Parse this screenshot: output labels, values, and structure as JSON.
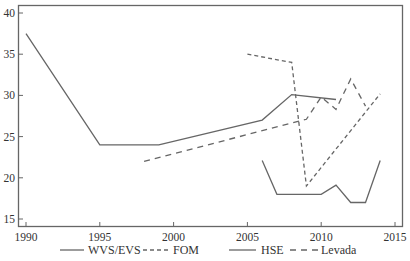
{
  "chart_data": {
    "type": "line",
    "title": "",
    "xlabel": "",
    "ylabel": "",
    "xlim": [
      1989.5,
      2015.5
    ],
    "ylim": [
      14.5,
      41
    ],
    "grid": false,
    "legend_position": "bottom",
    "x_ticks": [
      1990,
      1995,
      2000,
      2005,
      2010,
      2015
    ],
    "y_ticks": [
      15,
      20,
      25,
      30,
      35,
      40
    ],
    "series": [
      {
        "name": "WVS/EVS",
        "style": "solid",
        "x": [
          1990,
          1995,
          1999,
          2006,
          2008,
          2011
        ],
        "values": [
          37.5,
          24,
          24,
          27,
          30.1,
          29.5
        ]
      },
      {
        "name": "FOM",
        "style": "short-dash",
        "x": [
          2005,
          2008,
          2009,
          2014
        ],
        "values": [
          35,
          34,
          19,
          30.2
        ]
      },
      {
        "name": "HSE",
        "style": "solid",
        "x": [
          2006,
          2007,
          2010,
          2011,
          2012,
          2013,
          2014
        ],
        "values": [
          22.1,
          18,
          18,
          19.1,
          17,
          17,
          22.1
        ]
      },
      {
        "name": "Levada",
        "style": "long-dash",
        "x": [
          1998,
          2009,
          2010,
          2011,
          2012,
          2013
        ],
        "values": [
          22,
          27.1,
          29.8,
          28.3,
          32,
          28.7
        ]
      }
    ]
  },
  "legend": {
    "items": [
      {
        "label": "WVS/EVS",
        "style": "solid"
      },
      {
        "label": "FOM",
        "style": "short-dash"
      },
      {
        "label": "HSE",
        "style": "solid"
      },
      {
        "label": "Levada",
        "style": "long-dash"
      }
    ]
  },
  "axes": {
    "x_tick_labels": [
      "1990",
      "1995",
      "2000",
      "2005",
      "2010",
      "2015"
    ],
    "y_tick_labels": [
      "15",
      "20",
      "25",
      "30",
      "35",
      "40"
    ]
  },
  "colors": {
    "line": "#666666",
    "axis": "#555555",
    "text": "#333333"
  }
}
